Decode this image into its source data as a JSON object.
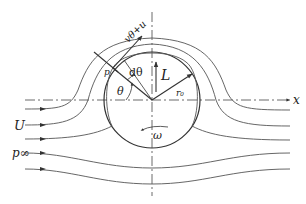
{
  "diagram": {
    "labels": {
      "velocity": "vθ+u",
      "pressure_surface": "p",
      "dtheta": "dθ",
      "theta": "θ",
      "lift": "L",
      "radius": "r₀",
      "x_axis": "x",
      "freestream_velocity": "U",
      "freestream_pressure": "p∞",
      "angular_velocity": "ω"
    },
    "elements": {
      "cylinder": {
        "shape": "circle",
        "center": [
          152,
          100
        ],
        "radius": 48
      },
      "x_axis": {
        "style": "dash-dot",
        "direction": "right"
      },
      "vertical_axis": {
        "style": "dash-dot"
      },
      "lift_arrow": {
        "direction": "up"
      },
      "rotation_arrow": {
        "direction": "counterclockwise"
      },
      "streamlines_above": 3,
      "streamlines_below": 3
    },
    "colors": {
      "line": "#555555",
      "text": "#222222",
      "background": "#ffffff"
    }
  }
}
